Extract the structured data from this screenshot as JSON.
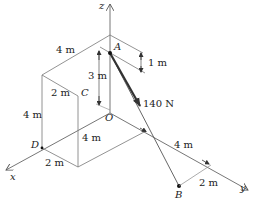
{
  "diagram": {
    "type": "3d-statics-geometry",
    "axes": {
      "x": "x",
      "y": "y",
      "z": "z"
    },
    "points": {
      "A": "A",
      "B": "B",
      "C": "C",
      "D": "D",
      "O": "O"
    },
    "force": {
      "label": "140 N",
      "from": "A",
      "toward": "B"
    },
    "dimensions": {
      "top_depth": "4 m",
      "a_drop_from_top": "1 m",
      "a_height_above_o": "3 m",
      "box_width_top": "2 m",
      "box_height": "4 m",
      "box_depth_bottom": "4 m",
      "x_offset_bottom": "2 m",
      "y_along": "4 m",
      "b_offset": "2 m"
    },
    "colors": {
      "line": "#555555",
      "thin_line": "#8a8a8a",
      "force": "#444444",
      "text": "#222222"
    }
  }
}
